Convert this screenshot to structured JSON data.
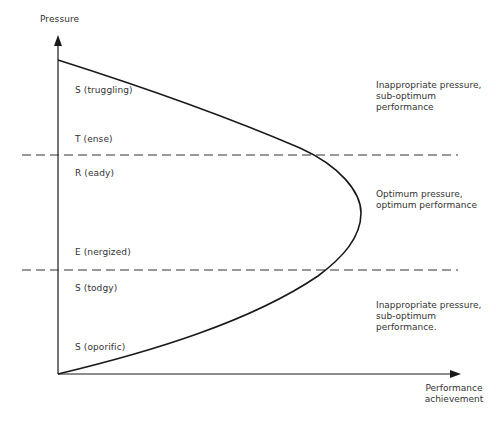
{
  "diagram": {
    "y_axis_label": "Pressure",
    "x_axis_label": "Performance\nachievement",
    "zones": [
      {
        "label": "S (truggling)"
      },
      {
        "label": "T (ense)"
      },
      {
        "label": "R (eady)"
      },
      {
        "label": "E (nergized)"
      },
      {
        "label": "S (todgy)"
      },
      {
        "label": "S (oporific)"
      }
    ],
    "annotations": [
      {
        "text": "Inappropriate pressure,\nsub-optimum\nperformance"
      },
      {
        "text": "Optimum pressure,\noptimum performance"
      },
      {
        "text": "Inappropriate pressure,\nsub-optimum\nperformance."
      }
    ],
    "colors": {
      "line": "#1a1a1a",
      "dash": "#333333",
      "text": "#333333"
    }
  }
}
